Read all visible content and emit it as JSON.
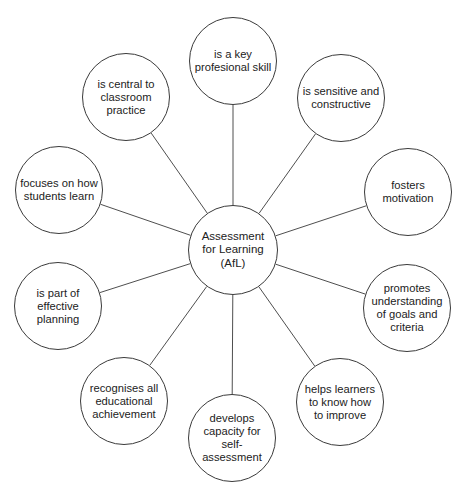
{
  "diagram": {
    "type": "mind-map",
    "hub": {
      "label": "Assessment\nfor Learning\n(AfL)",
      "cx": 233,
      "cy": 250,
      "r": 45
    },
    "nodes": [
      {
        "id": "key-skill",
        "label": "is a key\nprofesional skill",
        "cx": 233,
        "cy": 61,
        "r": 44
      },
      {
        "id": "central",
        "label": "is central to\nclassroom\npractice",
        "cx": 126,
        "cy": 97,
        "r": 44
      },
      {
        "id": "sensitive",
        "label": "is sensitive and\nconstructive",
        "cx": 341,
        "cy": 98,
        "r": 44
      },
      {
        "id": "focuses",
        "label": "focuses on how\nstudents learn",
        "cx": 59,
        "cy": 190,
        "r": 44
      },
      {
        "id": "fosters",
        "label": "fosters\nmotivation",
        "cx": 408,
        "cy": 192,
        "r": 44
      },
      {
        "id": "planning",
        "label": "is part of\neffective\nplanning",
        "cx": 58,
        "cy": 306,
        "r": 44
      },
      {
        "id": "promotes",
        "label": "promotes\nunderstanding\nof goals and\ncriteria",
        "cx": 407,
        "cy": 308,
        "r": 44
      },
      {
        "id": "recognises",
        "label": "recognises all\neducational\nachievement",
        "cx": 124,
        "cy": 401,
        "r": 44
      },
      {
        "id": "helps",
        "label": "helps learners\nto know how\nto improve",
        "cx": 340,
        "cy": 402,
        "r": 44
      },
      {
        "id": "develops",
        "label": "develops\ncapacity for self-\nassessment",
        "cx": 232,
        "cy": 438,
        "r": 44
      }
    ],
    "colors": {
      "stroke": "#3a3a3a",
      "text": "#222222",
      "background": "#ffffff"
    }
  }
}
